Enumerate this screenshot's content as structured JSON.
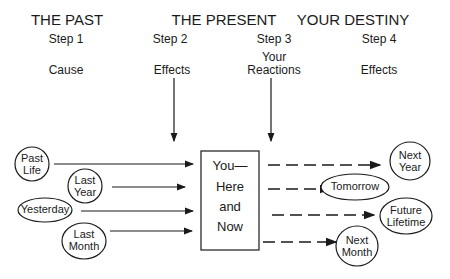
{
  "columns": [
    {
      "heading": "THE PAST",
      "step": "Step 1",
      "label": "Cause"
    },
    {
      "heading": "THE PRESENT",
      "step": "Step 2",
      "label": "Effects"
    },
    {
      "heading": "",
      "step": "Step 3",
      "label_line1": "Your",
      "label_line2": "Reactions"
    },
    {
      "heading": "YOUR DESTINY",
      "step": "Step 4",
      "label": "Effects"
    }
  ],
  "center_box": {
    "line1": "You—",
    "line2": "Here",
    "line3": "and",
    "line4": "Now"
  },
  "past_nodes": [
    {
      "line1": "Past",
      "line2": "Life"
    },
    {
      "line1": "Last",
      "line2": "Year"
    },
    {
      "line1": "Yesterday"
    },
    {
      "line1": "Last",
      "line2": "Month"
    }
  ],
  "future_nodes": [
    {
      "line1": "Next",
      "line2": "Year"
    },
    {
      "line1": "Tomorrow"
    },
    {
      "line1": "Future",
      "line2": "Lifetime"
    },
    {
      "line1": "Next",
      "line2": "Month"
    }
  ]
}
